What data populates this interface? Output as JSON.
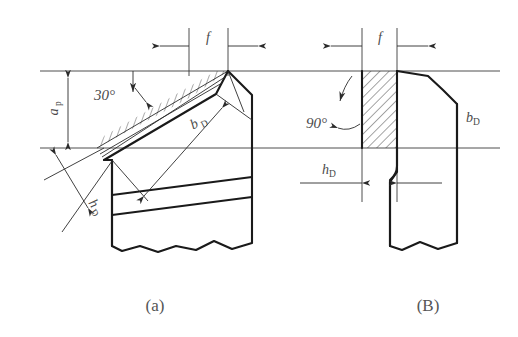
{
  "figure": {
    "title": "",
    "background_color": "#ffffff",
    "line_color": "#1a1a1a",
    "thin_line_color": "#3a3a3a",
    "label_color": "#4a4a4a",
    "caption_color": "#555555"
  },
  "panel_a": {
    "caption": "(a)",
    "angle_label": "30°",
    "feed_label": "f",
    "depth_label": "a",
    "depth_sub": "p",
    "chip_width_label": "b",
    "chip_width_sub": "D",
    "chip_thickness_label": "h",
    "chip_thickness_sub": "D"
  },
  "panel_b": {
    "caption": "(B)",
    "angle_label": "90°",
    "feed_label": "f",
    "chip_width_label": "b",
    "chip_width_sub": "D",
    "chip_thickness_label": "h",
    "chip_thickness_sub": "D"
  }
}
